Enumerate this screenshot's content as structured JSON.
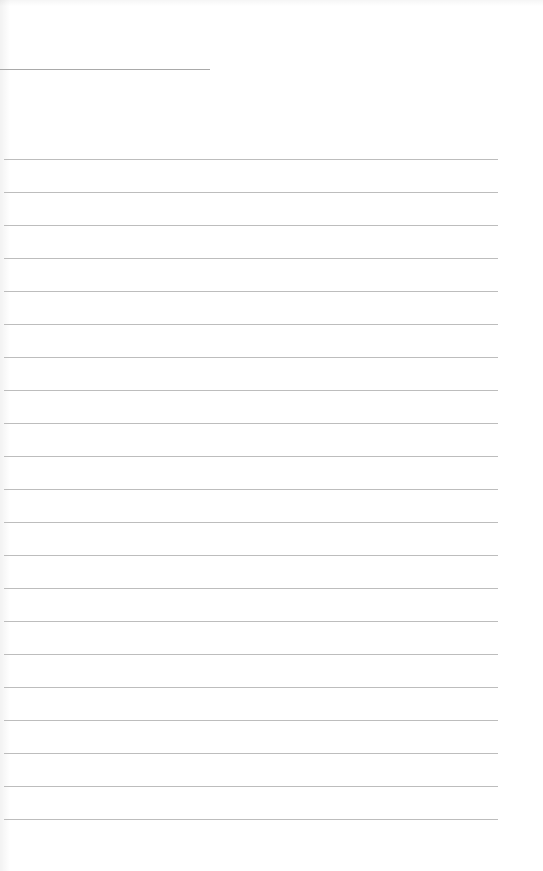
{
  "document": {
    "type": "blank lined writing sheet",
    "header_rule": {
      "x": 0,
      "y": 69,
      "width": 210,
      "color": "#a9a9a9"
    },
    "ruled_lines": {
      "count": 21,
      "first_y": 159,
      "spacing": 33,
      "left": 4,
      "right": 498,
      "color": "#bdbdbd"
    },
    "background_color": "#ffffff",
    "text_content": []
  }
}
